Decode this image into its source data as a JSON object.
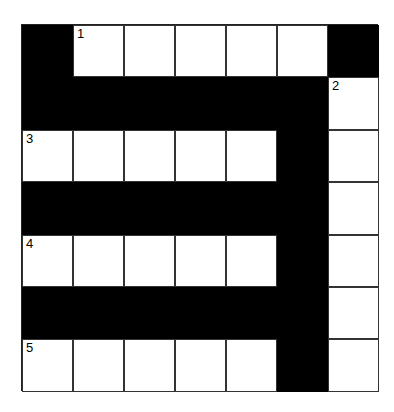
{
  "puzzle": {
    "rows": 7,
    "cols": 7,
    "colors": {
      "block": "#000000",
      "cell": "#ffffff",
      "line": "#333333"
    },
    "grid": [
      [
        "#",
        "1",
        "",
        "",
        "",
        "",
        "#"
      ],
      [
        "#",
        "#",
        "#",
        "#",
        "#",
        "#",
        "2"
      ],
      [
        "3",
        "",
        "",
        "",
        "",
        "#",
        ""
      ],
      [
        "#",
        "#",
        "#",
        "#",
        "#",
        "#",
        ""
      ],
      [
        "4",
        "",
        "",
        "",
        "",
        "#",
        ""
      ],
      [
        "#",
        "#",
        "#",
        "#",
        "#",
        "#",
        ""
      ],
      [
        "5",
        "",
        "",
        "",
        "",
        "#",
        ""
      ]
    ]
  }
}
